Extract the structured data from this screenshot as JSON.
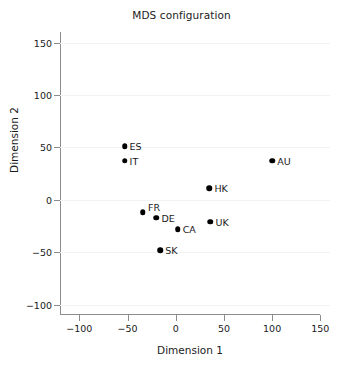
{
  "chart_data": {
    "type": "scatter",
    "title": "MDS configuration",
    "xlabel": "Dimension 1",
    "ylabel": "Dimension 2",
    "xlim": [
      -120,
      160
    ],
    "ylim": [
      -110,
      162
    ],
    "xticks": [
      -100,
      -50,
      0,
      50,
      100,
      150
    ],
    "xtick_labels": [
      "−100",
      "−50",
      "0",
      "50",
      "100",
      "150"
    ],
    "yticks": [
      -100,
      -50,
      0,
      50,
      100,
      150
    ],
    "ytick_labels": [
      "−100",
      "−50",
      "0",
      "50",
      "100",
      "150"
    ],
    "grid": "horizontal-only",
    "legend": "none",
    "marker_color": "#000000",
    "grid_color": "#f2f2f2",
    "axis_color": "#8c8c8c",
    "points": [
      {
        "label": "ES",
        "x": -53,
        "y": 51,
        "label_side": "right"
      },
      {
        "label": "IT",
        "x": -53,
        "y": 37,
        "label_side": "right"
      },
      {
        "label": "AU",
        "x": 100,
        "y": 37,
        "label_side": "right"
      },
      {
        "label": "HK",
        "x": 35,
        "y": 11,
        "label_side": "right"
      },
      {
        "label": "FR",
        "x": -34,
        "y": -12,
        "label_side": "right-up"
      },
      {
        "label": "DE",
        "x": -20,
        "y": -17,
        "label_side": "right"
      },
      {
        "label": "UK",
        "x": 36,
        "y": -21,
        "label_side": "right"
      },
      {
        "label": "CA",
        "x": 2,
        "y": -28,
        "label_side": "right"
      },
      {
        "label": "SK",
        "x": -16,
        "y": -48,
        "label_side": "right"
      }
    ]
  }
}
